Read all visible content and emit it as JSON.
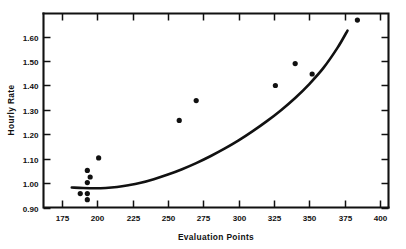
{
  "chart_data": {
    "type": "scatter",
    "title": "",
    "xlabel": "Evaluation Points",
    "ylabel": "Hourly Rate",
    "xlim": [
      162,
      406
    ],
    "ylim": [
      0.9,
      1.695
    ],
    "grid": false,
    "legend": false,
    "xticks": [
      175,
      200,
      225,
      250,
      275,
      300,
      325,
      350,
      375,
      400
    ],
    "xtick_labels": [
      "175",
      "200",
      "225",
      "250",
      "275",
      "300",
      "325",
      "350",
      "375",
      "400"
    ],
    "yticks": [
      0.9,
      1.0,
      1.1,
      1.2,
      1.3,
      1.4,
      1.5,
      1.6
    ],
    "ytick_labels": [
      "0.90",
      "1.00",
      "1.10",
      "1.20",
      "1.30",
      "1.40",
      "1.50",
      "1.60"
    ],
    "points": [
      {
        "x": 188,
        "y": 0.957
      },
      {
        "x": 193,
        "y": 0.957
      },
      {
        "x": 193,
        "y": 0.932
      },
      {
        "x": 193,
        "y": 1.002
      },
      {
        "x": 193,
        "y": 1.052
      },
      {
        "x": 195,
        "y": 1.025
      },
      {
        "x": 201,
        "y": 1.103
      },
      {
        "x": 258,
        "y": 1.257
      },
      {
        "x": 270,
        "y": 1.338
      },
      {
        "x": 326,
        "y": 1.4
      },
      {
        "x": 340,
        "y": 1.49
      },
      {
        "x": 352,
        "y": 1.447
      },
      {
        "x": 384,
        "y": 1.668
      }
    ],
    "series": [
      {
        "name": "fitted-curve",
        "type": "line",
        "x": [
          182,
          190,
          198,
          206,
          214,
          222,
          230,
          240,
          250,
          260,
          270,
          280,
          290,
          300,
          310,
          320,
          330,
          340,
          350,
          360,
          370,
          377
        ],
        "y": [
          0.982,
          0.98,
          0.979,
          0.98,
          0.984,
          0.991,
          1.0,
          1.016,
          1.035,
          1.057,
          1.082,
          1.11,
          1.141,
          1.175,
          1.213,
          1.254,
          1.299,
          1.349,
          1.406,
          1.472,
          1.555,
          1.625
        ]
      }
    ]
  },
  "axis": {
    "x_title": "Evaluation Points",
    "y_title": "Hourly Rate"
  }
}
